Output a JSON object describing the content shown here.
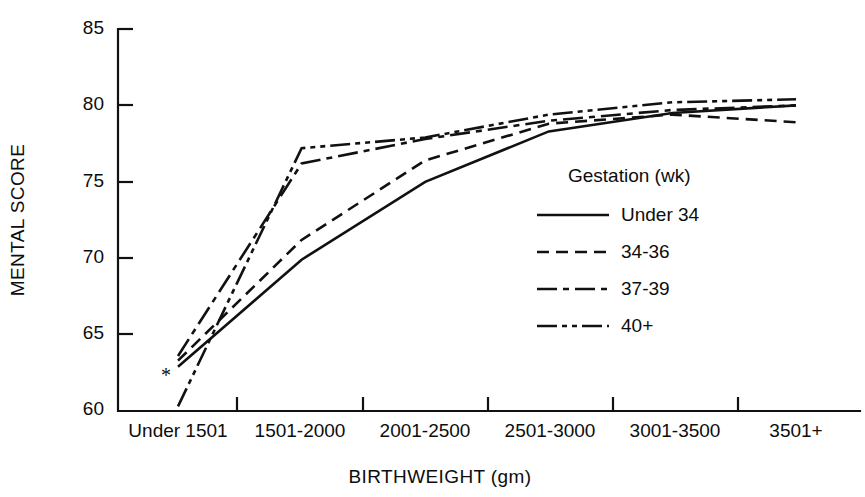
{
  "chart_data": {
    "type": "line",
    "title": "",
    "xlabel": "BIRTHWEIGHT (gm)",
    "ylabel": "MENTAL SCORE",
    "categories": [
      "Under 1501",
      "1501-2000",
      "2001-2500",
      "2501-3000",
      "3001-3500",
      "3501+"
    ],
    "ylim": [
      60,
      85
    ],
    "yticks": [
      60,
      65,
      70,
      75,
      80,
      85
    ],
    "ytick_labels": [
      "60",
      "65",
      "70",
      "75",
      "80",
      "85"
    ],
    "grid": false,
    "legend_position": "right-middle",
    "legend_title": "Gestation (wk)",
    "annotations": [
      {
        "text": "*",
        "category": "Under 1501",
        "value": 62.3,
        "note": "asterisk marker near lowest starting point"
      }
    ],
    "series": [
      {
        "name": "Under 34",
        "style": "solid",
        "dash": "none",
        "values": [
          62.9,
          69.9,
          75.0,
          78.3,
          79.5,
          80.0
        ]
      },
      {
        "name": "34-36",
        "style": "dashed",
        "dash": "12,7",
        "values": [
          63.3,
          71.2,
          76.4,
          78.8,
          79.4,
          78.9
        ]
      },
      {
        "name": "37-39",
        "style": "dash-dot",
        "dash": "20,6,6,6",
        "values": [
          63.6,
          76.2,
          77.8,
          79.0,
          79.7,
          80.0
        ]
      },
      {
        "name": "40+",
        "style": "dash-dot-dot",
        "dash": "20,5,5,5,5,5",
        "values": [
          60.3,
          77.2,
          77.9,
          79.4,
          80.2,
          80.4
        ]
      }
    ]
  },
  "legend": {
    "title": "Gestation (wk)",
    "items": [
      {
        "label": "Under 34"
      },
      {
        "label": "34-36"
      },
      {
        "label": "37-39"
      },
      {
        "label": "40+"
      }
    ]
  },
  "axes": {
    "y_title": "MENTAL SCORE",
    "x_title": "BIRTHWEIGHT (gm)"
  }
}
